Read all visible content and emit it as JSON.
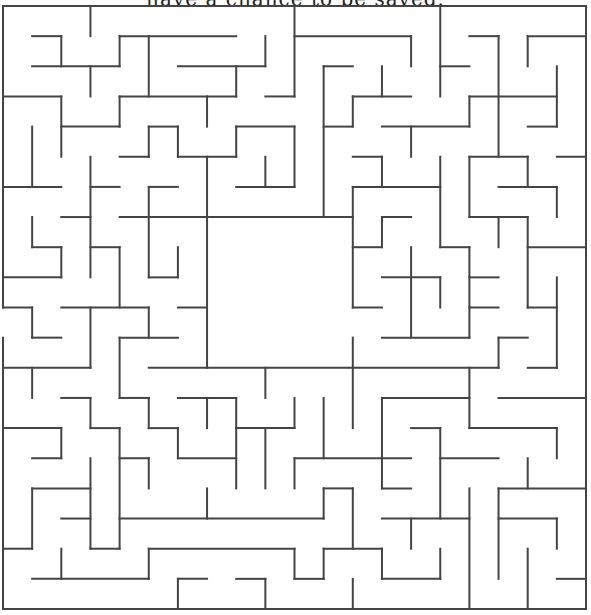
{
  "caption": "have a chance to be saved.",
  "maze": {
    "cols": 20,
    "rows": 20,
    "wall_color": "#444444",
    "background_color": "#ffffff",
    "entrance": {
      "side": "left",
      "row": 10
    },
    "border": [
      [
        0,
        0,
        20,
        0
      ],
      [
        0,
        20,
        20,
        20
      ],
      [
        20,
        0,
        20,
        20
      ],
      [
        0,
        0,
        0,
        10
      ],
      [
        0,
        11,
        0,
        20
      ]
    ],
    "horizontal_walls": [
      [
        1,
        1,
        2,
        1
      ],
      [
        4,
        1,
        8,
        1
      ],
      [
        10,
        1,
        14,
        1
      ],
      [
        16,
        1,
        17,
        1
      ],
      [
        18,
        1,
        20,
        1
      ],
      [
        1,
        2,
        4,
        2
      ],
      [
        6,
        2,
        9,
        2
      ],
      [
        11,
        2,
        12,
        2
      ],
      [
        15,
        2,
        16,
        2
      ],
      [
        0,
        3,
        2,
        3
      ],
      [
        4,
        3,
        8,
        3
      ],
      [
        9,
        3,
        10,
        3
      ],
      [
        12,
        3,
        14,
        3
      ],
      [
        16,
        3,
        19,
        3
      ],
      [
        2,
        4,
        4,
        4
      ],
      [
        5,
        4,
        6,
        4
      ],
      [
        8,
        4,
        10,
        4
      ],
      [
        11,
        4,
        12,
        4
      ],
      [
        13,
        4,
        16,
        4
      ],
      [
        18,
        4,
        19,
        4
      ],
      [
        4,
        5,
        5,
        5
      ],
      [
        6,
        5,
        8,
        5
      ],
      [
        12,
        5,
        13,
        5
      ],
      [
        16,
        5,
        18,
        5
      ],
      [
        19,
        5,
        20,
        5
      ],
      [
        0,
        6,
        2,
        6
      ],
      [
        3,
        6,
        4,
        6
      ],
      [
        5,
        6,
        6,
        6
      ],
      [
        8,
        6,
        10,
        6
      ],
      [
        12,
        6,
        15,
        6
      ],
      [
        17,
        6,
        19,
        6
      ],
      [
        2,
        7,
        3,
        7
      ],
      [
        4,
        7,
        12,
        7
      ],
      [
        13,
        7,
        14,
        7
      ],
      [
        16,
        7,
        18,
        7
      ],
      [
        1,
        8,
        2,
        8
      ],
      [
        3,
        8,
        4,
        8
      ],
      [
        12,
        8,
        13,
        8
      ],
      [
        15,
        8,
        16,
        8
      ],
      [
        18,
        8,
        20,
        8
      ],
      [
        0,
        9,
        2,
        9
      ],
      [
        5,
        9,
        6,
        9
      ],
      [
        13,
        9,
        15,
        9
      ],
      [
        16,
        9,
        17,
        9
      ],
      [
        0,
        10,
        1,
        10
      ],
      [
        2,
        10,
        5,
        10
      ],
      [
        6,
        10,
        7,
        10
      ],
      [
        12,
        10,
        13,
        10
      ],
      [
        16,
        10,
        17,
        10
      ],
      [
        18,
        10,
        19,
        10
      ],
      [
        1,
        11,
        2,
        11
      ],
      [
        4,
        11,
        6,
        11
      ],
      [
        13,
        11,
        16,
        11
      ],
      [
        17,
        11,
        18,
        11
      ],
      [
        0,
        12,
        3,
        12
      ],
      [
        5,
        12,
        17,
        12
      ],
      [
        18,
        12,
        19,
        12
      ],
      [
        2,
        13,
        3,
        13
      ],
      [
        4,
        13,
        5,
        13
      ],
      [
        6,
        13,
        8,
        13
      ],
      [
        13,
        13,
        16,
        13
      ],
      [
        17,
        13,
        20,
        13
      ],
      [
        0,
        14,
        2,
        14
      ],
      [
        3,
        14,
        4,
        14
      ],
      [
        5,
        14,
        6,
        14
      ],
      [
        8,
        14,
        10,
        14
      ],
      [
        14,
        14,
        15,
        14
      ],
      [
        16,
        14,
        19,
        14
      ],
      [
        1,
        15,
        2,
        15
      ],
      [
        4,
        15,
        5,
        15
      ],
      [
        6,
        15,
        8,
        15
      ],
      [
        10,
        15,
        14,
        15
      ],
      [
        15,
        15,
        17,
        15
      ],
      [
        1,
        16,
        3,
        16
      ],
      [
        11,
        16,
        12,
        16
      ],
      [
        13,
        16,
        14,
        16
      ],
      [
        17,
        16,
        20,
        16
      ],
      [
        2,
        17,
        3,
        17
      ],
      [
        4,
        17,
        11,
        17
      ],
      [
        13,
        17,
        16,
        17
      ],
      [
        17,
        17,
        19,
        17
      ],
      [
        0,
        18,
        1,
        18
      ],
      [
        3,
        18,
        4,
        18
      ],
      [
        5,
        18,
        10,
        18
      ],
      [
        11,
        18,
        13,
        18
      ],
      [
        1,
        19,
        5,
        19
      ],
      [
        6,
        19,
        7,
        19
      ],
      [
        8,
        19,
        9,
        19
      ],
      [
        10,
        19,
        11,
        19
      ],
      [
        13,
        19,
        15,
        19
      ],
      [
        19,
        19,
        20,
        19
      ]
    ],
    "vertical_walls": [
      [
        1,
        4,
        1,
        6
      ],
      [
        1,
        7,
        1,
        8
      ],
      [
        1,
        10,
        1,
        11
      ],
      [
        1,
        12,
        1,
        13
      ],
      [
        1,
        16,
        1,
        18
      ],
      [
        2,
        1,
        2,
        2
      ],
      [
        2,
        3,
        2,
        5
      ],
      [
        2,
        8,
        2,
        9
      ],
      [
        2,
        14,
        2,
        15
      ],
      [
        2,
        18,
        2,
        19
      ],
      [
        3,
        0,
        3,
        1
      ],
      [
        3,
        2,
        3,
        3
      ],
      [
        3,
        5,
        3,
        9
      ],
      [
        3,
        10,
        3,
        12
      ],
      [
        3,
        13,
        3,
        14
      ],
      [
        3,
        15,
        3,
        18
      ],
      [
        4,
        1,
        4,
        2
      ],
      [
        4,
        3,
        4,
        4
      ],
      [
        4,
        8,
        4,
        10
      ],
      [
        4,
        11,
        4,
        13
      ],
      [
        4,
        14,
        4,
        18
      ],
      [
        5,
        1,
        5,
        3
      ],
      [
        5,
        4,
        5,
        5
      ],
      [
        5,
        6,
        5,
        9
      ],
      [
        5,
        10,
        5,
        11
      ],
      [
        5,
        13,
        5,
        14
      ],
      [
        5,
        15,
        5,
        16
      ],
      [
        5,
        18,
        5,
        19
      ],
      [
        6,
        4,
        6,
        5
      ],
      [
        6,
        8,
        6,
        9
      ],
      [
        6,
        14,
        6,
        15
      ],
      [
        6,
        19,
        6,
        20
      ],
      [
        7,
        3,
        7,
        4
      ],
      [
        7,
        5,
        7,
        12
      ],
      [
        7,
        13,
        7,
        14
      ],
      [
        7,
        16,
        7,
        17
      ],
      [
        8,
        2,
        8,
        3
      ],
      [
        8,
        4,
        8,
        5
      ],
      [
        8,
        13,
        8,
        16
      ],
      [
        9,
        1,
        9,
        2
      ],
      [
        9,
        5,
        9,
        6
      ],
      [
        9,
        12,
        9,
        13
      ],
      [
        9,
        14,
        9,
        16
      ],
      [
        9,
        19,
        9,
        20
      ],
      [
        10,
        0,
        10,
        3
      ],
      [
        10,
        4,
        10,
        6
      ],
      [
        10,
        13,
        10,
        14
      ],
      [
        10,
        15,
        10,
        16
      ],
      [
        10,
        18,
        10,
        19
      ],
      [
        11,
        2,
        11,
        7
      ],
      [
        11,
        13,
        11,
        15
      ],
      [
        11,
        16,
        11,
        17
      ],
      [
        11,
        18,
        11,
        19
      ],
      [
        12,
        3,
        12,
        4
      ],
      [
        12,
        6,
        12,
        10
      ],
      [
        12,
        11,
        12,
        14
      ],
      [
        12,
        16,
        12,
        18
      ],
      [
        12,
        19,
        12,
        20
      ],
      [
        13,
        2,
        13,
        3
      ],
      [
        13,
        5,
        13,
        6
      ],
      [
        13,
        7,
        13,
        8
      ],
      [
        13,
        13,
        13,
        16
      ],
      [
        13,
        18,
        13,
        19
      ],
      [
        14,
        1,
        14,
        2
      ],
      [
        14,
        4,
        14,
        5
      ],
      [
        14,
        8,
        14,
        11
      ],
      [
        14,
        17,
        14,
        18
      ],
      [
        15,
        0,
        15,
        3
      ],
      [
        15,
        5,
        15,
        8
      ],
      [
        15,
        9,
        15,
        10
      ],
      [
        15,
        14,
        15,
        17
      ],
      [
        15,
        18,
        15,
        19
      ],
      [
        16,
        3,
        16,
        4
      ],
      [
        16,
        5,
        16,
        7
      ],
      [
        16,
        8,
        16,
        11
      ],
      [
        16,
        12,
        16,
        14
      ],
      [
        16,
        16,
        16,
        20
      ],
      [
        17,
        1,
        17,
        5
      ],
      [
        17,
        7,
        17,
        8
      ],
      [
        17,
        11,
        17,
        12
      ],
      [
        17,
        16,
        17,
        19
      ],
      [
        18,
        1,
        18,
        2
      ],
      [
        18,
        5,
        18,
        6
      ],
      [
        18,
        7,
        18,
        10
      ],
      [
        18,
        15,
        18,
        16
      ],
      [
        18,
        18,
        18,
        20
      ],
      [
        19,
        2,
        19,
        4
      ],
      [
        19,
        6,
        19,
        7
      ],
      [
        19,
        9,
        19,
        12
      ],
      [
        19,
        14,
        19,
        15
      ],
      [
        19,
        17,
        19,
        18
      ]
    ]
  }
}
